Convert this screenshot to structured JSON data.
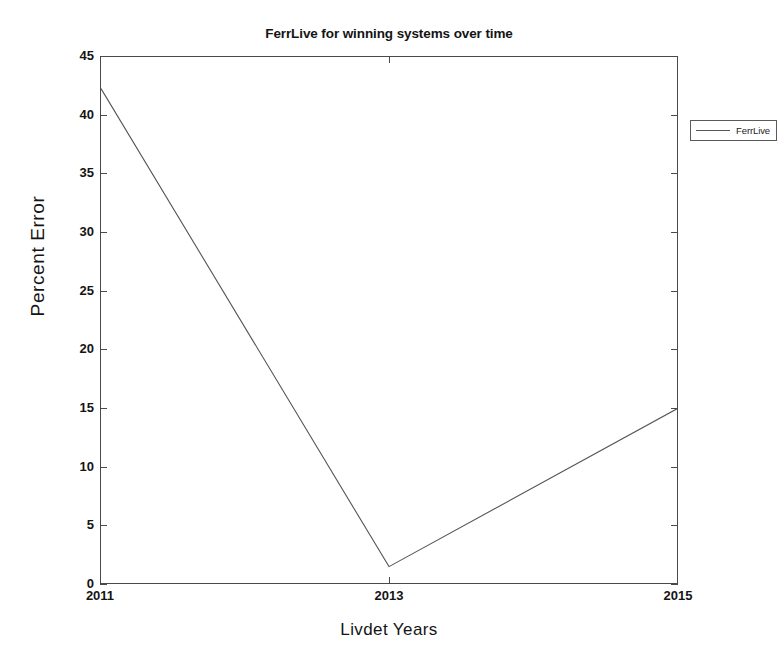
{
  "chart_data": {
    "type": "line",
    "title": "FerrLive for winning systems over time",
    "xlabel": "Livdet Years",
    "ylabel": "Percent  Error",
    "x": [
      2011,
      2013,
      2015
    ],
    "xticklabels": [
      "2011",
      "2013",
      "2015"
    ],
    "yticklabels": [
      "0",
      "5",
      "10",
      "15",
      "20",
      "25",
      "30",
      "35",
      "40",
      "45"
    ],
    "yticks": [
      0,
      5,
      10,
      15,
      20,
      25,
      30,
      35,
      40,
      45
    ],
    "ylim": [
      0,
      45
    ],
    "xlim": [
      2011,
      2015
    ],
    "grid": false,
    "legend_position": "top-right",
    "series": [
      {
        "name": "FerrLive",
        "values": [
          42.3,
          1.4,
          14.9
        ],
        "color": "#555555"
      }
    ]
  },
  "legend": {
    "entries": [
      {
        "label": "FerrLive"
      }
    ]
  },
  "axes": {
    "line_color": "#4a4a4a",
    "background": "#ffffff"
  }
}
